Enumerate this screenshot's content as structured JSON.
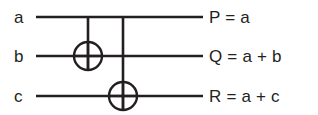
{
  "figure": {
    "background_color": "#ffffff",
    "ink_color": "#231f20"
  },
  "inputs": [
    {
      "label": "a",
      "wire_y": 17
    },
    {
      "label": "b",
      "wire_y": 56
    },
    {
      "label": "c",
      "wire_y": 96
    }
  ],
  "outputs": [
    {
      "label": "P = a"
    },
    {
      "label": "Q = a + b"
    },
    {
      "label": "R = a + c"
    }
  ],
  "gates": [
    {
      "name": "xor-gate-1",
      "symbol": "circle-plus",
      "cx": 88,
      "cy": 56,
      "r": 14
    },
    {
      "name": "xor-gate-2",
      "symbol": "circle-plus",
      "cx": 123,
      "cy": 96,
      "r": 14
    }
  ],
  "connections": [
    {
      "name": "control-a-to-xor1",
      "from_y": 17,
      "to_y": 70,
      "x": 88
    },
    {
      "name": "control-a-to-xor2",
      "from_y": 17,
      "to_y": 110,
      "x": 123
    }
  ],
  "wires": [
    {
      "name": "wire-a",
      "x1": 36,
      "x2": 203,
      "y": 17
    },
    {
      "name": "wire-b",
      "x1": 36,
      "x2": 203,
      "y": 56
    },
    {
      "name": "wire-c",
      "x1": 36,
      "x2": 203,
      "y": 96
    }
  ]
}
